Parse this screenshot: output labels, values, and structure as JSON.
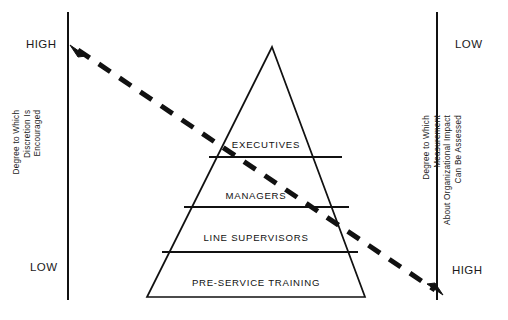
{
  "diagram": {
    "type": "pyramid-with-dual-axes",
    "background_color": "#ffffff",
    "line_color": "#111111",
    "pyramid": {
      "name": "organizational-hierarchy-pyramid",
      "apex": {
        "x": 272,
        "y": 47
      },
      "base_left": {
        "x": 147,
        "y": 297
      },
      "base_right": {
        "x": 365,
        "y": 297
      },
      "tiers": [
        {
          "label": "EXECUTIVES",
          "level": 1,
          "divider_y": 157
        },
        {
          "label": "MANAGERS",
          "level": 2,
          "divider_y": 207
        },
        {
          "label": "LINE SUPERVISORS",
          "level": 3,
          "divider_y": 252
        },
        {
          "label": "PRE-SERVICE TRAINING",
          "level": 4,
          "divider_y": 297
        }
      ]
    },
    "left_axis": {
      "name": "discretion-axis",
      "x": 68,
      "y_top": 12,
      "y_bottom": 300,
      "caption": "Degree to Which\nDiscretion Is\nEncouraged",
      "top_label": "HIGH",
      "bottom_label": "LOW"
    },
    "right_axis": {
      "name": "measurement-axis",
      "x": 437,
      "y_top": 12,
      "y_bottom": 300,
      "caption": "Degree to Which Measurement\nAbout Organizational Impact\nCan Be Assessed",
      "top_label": "LOW",
      "bottom_label": "HIGH"
    },
    "trend_arrow": {
      "name": "dashed-trend-arrow",
      "style": "dashed",
      "double_headed": true,
      "start": {
        "x": 70,
        "y": 45
      },
      "end": {
        "x": 443,
        "y": 295
      },
      "stroke_width": 5,
      "dash_pattern": "14 11"
    }
  }
}
